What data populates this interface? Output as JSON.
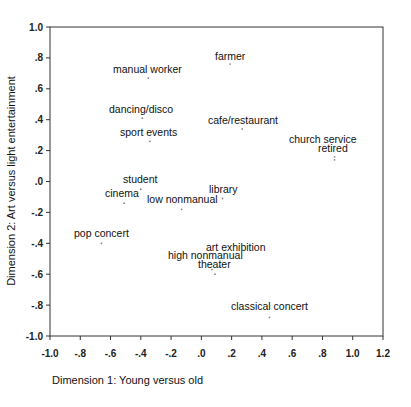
{
  "chart_data": {
    "type": "scatter",
    "title": "",
    "xlabel": "Dimension 1: Young versus old",
    "ylabel": "Dimension 2: Art versus light entertainment",
    "xlim": [
      -1.0,
      1.2
    ],
    "ylim": [
      -1.0,
      1.0
    ],
    "grid": false,
    "legend": null,
    "x_ticks": [
      "-1.0",
      "-.8",
      "-.6",
      "-.4",
      "-.2",
      ".0",
      ".2",
      ".4",
      ".6",
      ".8",
      "1.0",
      "1.2"
    ],
    "y_ticks": [
      "1.0",
      ".8",
      ".6",
      ".4",
      ".2",
      ".0",
      "-.2",
      "-.4",
      "-.6",
      "-.8",
      "-1.0"
    ],
    "points": [
      {
        "label": "farmer",
        "x": 0.19,
        "y": 0.76
      },
      {
        "label": "manual worker",
        "x": -0.35,
        "y": 0.67
      },
      {
        "label": "dancing/disco",
        "x": -0.39,
        "y": 0.41
      },
      {
        "label": "cafe/restaurant",
        "x": 0.27,
        "y": 0.34
      },
      {
        "label": "sport events",
        "x": -0.34,
        "y": 0.26
      },
      {
        "label": "church service",
        "x": 0.88,
        "y": 0.16
      },
      {
        "label": "retired",
        "x": 0.88,
        "y": 0.14
      },
      {
        "label": "student",
        "x": -0.4,
        "y": -0.05
      },
      {
        "label": "cinema",
        "x": -0.51,
        "y": -0.14
      },
      {
        "label": "library",
        "x": 0.14,
        "y": -0.11
      },
      {
        "label": "low nonmanual",
        "x": -0.13,
        "y": -0.18
      },
      {
        "label": "pop concert",
        "x": -0.66,
        "y": -0.4
      },
      {
        "label": "art exhibition",
        "x": 0.12,
        "y": -0.55
      },
      {
        "label": "high nonmanual",
        "x": 0.07,
        "y": -0.57
      },
      {
        "label": "theater",
        "x": 0.09,
        "y": -0.6
      },
      {
        "label": "classical concert",
        "x": 0.45,
        "y": -0.88
      }
    ]
  },
  "labels_layout": [
    {
      "text": "farmer",
      "lx": 215,
      "ly": 60
    },
    {
      "text": "manual worker",
      "lx": 113,
      "ly": 73
    },
    {
      "text": "dancing/disco",
      "lx": 109,
      "ly": 113
    },
    {
      "text": "cafe/restaurant",
      "lx": 208,
      "ly": 124
    },
    {
      "text": "sport events",
      "lx": 120,
      "ly": 136
    },
    {
      "text": "church service",
      "lx": 289,
      "ly": 143
    },
    {
      "text": "retired",
      "lx": 318,
      "ly": 152
    },
    {
      "text": "student",
      "lx": 123,
      "ly": 183
    },
    {
      "text": "cinema",
      "lx": 105,
      "ly": 197
    },
    {
      "text": "library",
      "lx": 209,
      "ly": 193
    },
    {
      "text": "low nonmanual",
      "lx": 147,
      "ly": 203
    },
    {
      "text": "pop concert",
      "lx": 74,
      "ly": 237
    },
    {
      "text": "art exhibition",
      "lx": 206,
      "ly": 251
    },
    {
      "text": "high nonmanual",
      "lx": 168,
      "ly": 259
    },
    {
      "text": "theater",
      "lx": 198,
      "ly": 268
    },
    {
      "text": "classical concert",
      "lx": 231,
      "ly": 310
    }
  ]
}
